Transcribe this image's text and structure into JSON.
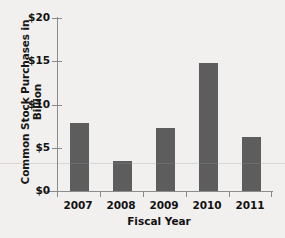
{
  "chart_data": {
    "type": "bar",
    "title": "",
    "xlabel": "Fiscal Year",
    "ylabel": "Common Stock Purchases in Billion",
    "categories": [
      "2007",
      "2008",
      "2009",
      "2010",
      "2011"
    ],
    "values": [
      7.8,
      3.4,
      7.3,
      14.7,
      6.2
    ],
    "ylim": [
      0,
      20
    ],
    "yticks": [
      0,
      5,
      10,
      15,
      20
    ],
    "ytick_labels": [
      "$0",
      "$5",
      "$10",
      "$15",
      "$20"
    ],
    "grid": false,
    "legend": null,
    "bar_color": "#5d5d5d",
    "background_color": "#f1f0ee",
    "axis_color": "#8b8b8b"
  },
  "figure": {
    "title_sliver": "",
    "axis_title_x": "Fiscal Year",
    "axis_title_y": "Common Stock Purchases in Billion",
    "ytick_0": "$0",
    "ytick_1": "$5",
    "ytick_2": "$10",
    "ytick_3": "$15",
    "ytick_4": "$20",
    "xtick_0": "2007",
    "xtick_1": "2008",
    "xtick_2": "2009",
    "xtick_3": "2010",
    "xtick_4": "2011"
  }
}
